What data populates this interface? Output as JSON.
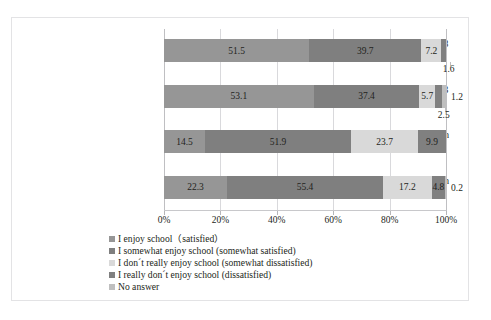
{
  "chart_data": {
    "type": "bar",
    "subtype": "horizontal-stacked-100",
    "title": "",
    "xlabel": "",
    "ylabel": "",
    "xlim": [
      0,
      100
    ],
    "grid": true,
    "legend_position": "bottom-left",
    "xticks": [
      "0%",
      "20%",
      "40%",
      "60%",
      "80%",
      "100%"
    ],
    "xtick_values": [
      0,
      20,
      40,
      60,
      80,
      100
    ],
    "categories": [
      "All elementary schools, 1998 (n=4,579)",
      "All elementary schools, 2003 (n=4,771)",
      "2nd year students, junior high schools, 1998 (n=1,989)",
      "2nd year students, junior high schools, 2003 (n=2,396)"
    ],
    "category_lines": [
      [
        "All elementary schools, 1998",
        "(n=4,579)"
      ],
      [
        "All elementary schools, 2003",
        "(n=4,771)"
      ],
      [
        "2nd year students, junior high",
        "schools, 1998 (n=1,989)"
      ],
      [
        "2nd year students, junior high",
        "schools, 2003 (n=2,396)"
      ]
    ],
    "series": [
      {
        "name": "I enjoy school（satisfied）",
        "color": "#969696",
        "values": [
          51.5,
          53.1,
          14.5,
          22.3
        ]
      },
      {
        "name": "I somewhat enjoy school (somewhat satisfied)",
        "color": "#7f7f7f",
        "values": [
          39.7,
          37.4,
          51.9,
          55.4
        ]
      },
      {
        "name": "I don´t really enjoy school (somewhat dissatisfied)",
        "color": "#d9d9d9",
        "values": [
          7.2,
          5.7,
          23.7,
          17.2
        ]
      },
      {
        "name": "I really don´t enjoy school (dissatisfied)",
        "color": "#808080",
        "values": [
          1.6,
          2.5,
          9.9,
          4.8
        ]
      },
      {
        "name": "No answer",
        "color": "#bfbfbf",
        "values": [
          0.0,
          1.2,
          0.0,
          0.2
        ]
      }
    ],
    "bars": [
      {
        "category_index": 0,
        "segments": [
          {
            "series": 0,
            "value": 51.5,
            "label": "51.5",
            "label_inside": true
          },
          {
            "series": 1,
            "value": 39.7,
            "label": "39.7",
            "label_inside": true
          },
          {
            "series": 2,
            "value": 7.2,
            "label": "7.2",
            "label_inside": true
          },
          {
            "series": 3,
            "value": 1.6,
            "label": "1.6",
            "label_inside": false
          },
          {
            "series": 4,
            "value": 0.0,
            "label": "",
            "label_inside": false
          }
        ]
      },
      {
        "category_index": 1,
        "segments": [
          {
            "series": 0,
            "value": 53.1,
            "label": "53.1",
            "label_inside": true
          },
          {
            "series": 1,
            "value": 37.4,
            "label": "37.4",
            "label_inside": true
          },
          {
            "series": 2,
            "value": 5.7,
            "label": "5.7",
            "label_inside": true
          },
          {
            "series": 3,
            "value": 2.5,
            "label": "2.5",
            "label_inside": false
          },
          {
            "series": 4,
            "value": 1.2,
            "label": "1.2",
            "label_inside": false
          }
        ]
      },
      {
        "category_index": 2,
        "segments": [
          {
            "series": 0,
            "value": 14.5,
            "label": "14.5",
            "label_inside": true
          },
          {
            "series": 1,
            "value": 51.9,
            "label": "51.9",
            "label_inside": true
          },
          {
            "series": 2,
            "value": 23.7,
            "label": "23.7",
            "label_inside": true
          },
          {
            "series": 3,
            "value": 9.9,
            "label": "9.9",
            "label_inside": true
          },
          {
            "series": 4,
            "value": 0.0,
            "label": "",
            "label_inside": false
          }
        ]
      },
      {
        "category_index": 3,
        "segments": [
          {
            "series": 0,
            "value": 22.3,
            "label": "22.3",
            "label_inside": true
          },
          {
            "series": 1,
            "value": 55.4,
            "label": "55.4",
            "label_inside": true
          },
          {
            "series": 2,
            "value": 17.2,
            "label": "17.2",
            "label_inside": true
          },
          {
            "series": 3,
            "value": 4.8,
            "label": "4.8",
            "label_inside": true
          },
          {
            "series": 4,
            "value": 0.2,
            "label": "0.2",
            "label_inside": false
          }
        ]
      }
    ]
  }
}
